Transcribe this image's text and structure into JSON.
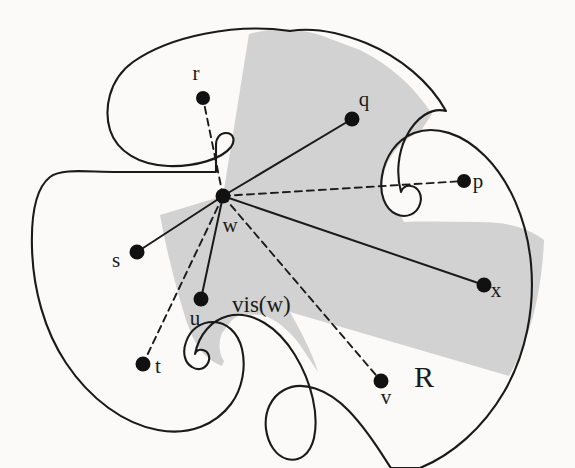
{
  "figure": {
    "colors": {
      "paper_background": "#fbfaf8",
      "shaded_region": "#d2d2d2",
      "outline": "#1a1a1a",
      "vertex": "#111111",
      "visible_edge": "#1a1a1a",
      "blocked_edge": "#1a1a1a"
    },
    "region_labels": [
      {
        "id": "vis-w",
        "text": "vis(w)",
        "x": 232,
        "y": 312,
        "size": "region"
      },
      {
        "id": "R",
        "text": "R",
        "x": 414,
        "y": 387,
        "size": "big"
      }
    ],
    "points": [
      {
        "id": "w",
        "label": "w",
        "x": 223,
        "y": 196,
        "label_x": 230,
        "label_y": 232,
        "r": 7.5
      },
      {
        "id": "r",
        "label": "r",
        "x": 203,
        "y": 98,
        "label_x": 196,
        "label_y": 80,
        "r": 7
      },
      {
        "id": "q",
        "label": "q",
        "x": 352,
        "y": 119,
        "label_x": 364,
        "label_y": 106,
        "r": 7.5
      },
      {
        "id": "p",
        "label": "p",
        "x": 464,
        "y": 181,
        "label_x": 478,
        "label_y": 188,
        "r": 7
      },
      {
        "id": "s",
        "label": "s",
        "x": 137,
        "y": 252,
        "label_x": 116,
        "label_y": 267,
        "r": 7.5
      },
      {
        "id": "u",
        "label": "u",
        "x": 201,
        "y": 299,
        "label_x": 195,
        "label_y": 325,
        "r": 7.5
      },
      {
        "id": "t",
        "label": "t",
        "x": 143,
        "y": 364,
        "label_x": 158,
        "label_y": 373,
        "r": 7.5
      },
      {
        "id": "v",
        "label": "v",
        "x": 381,
        "y": 381,
        "label_x": 386,
        "label_y": 404,
        "r": 7.5
      },
      {
        "id": "x",
        "label": "x",
        "x": 484,
        "y": 285,
        "label_x": 496,
        "label_y": 297,
        "r": 7.5
      }
    ],
    "edges": [
      {
        "id": "w-q",
        "from": "w",
        "to": "q",
        "style": "solid",
        "visible": true
      },
      {
        "id": "w-s",
        "from": "w",
        "to": "s",
        "style": "solid",
        "visible": true
      },
      {
        "id": "w-u",
        "from": "w",
        "to": "u",
        "style": "solid",
        "visible": true
      },
      {
        "id": "w-x",
        "from": "w",
        "to": "x",
        "style": "solid",
        "visible": true
      },
      {
        "id": "w-r",
        "from": "w",
        "to": "r",
        "style": "dashed",
        "visible": false
      },
      {
        "id": "w-p",
        "from": "w",
        "to": "p",
        "style": "dashed",
        "visible": false
      },
      {
        "id": "w-t",
        "from": "w",
        "to": "t",
        "style": "dashed",
        "visible": false
      },
      {
        "id": "w-v",
        "from": "w",
        "to": "v",
        "style": "dashed",
        "visible": false
      }
    ],
    "geometry": {
      "region_outline": "M 290 31 C 235 23 170 36 133 62 C 108 80 104 110 110 130 C 117 152 140 165 168 166 C 195 167 222 159 231 147 C 236 140 233 133 226 133 C 220 133 216 138 216 145 L 216 172 L 118 172 C 86 172 62 168 50 177 C 36 188 31 214 32 248 C 33 288 44 330 66 363 C 90 399 124 424 158 430 C 190 436 216 424 231 404 C 243 388 246 366 242 349 C 238 332 226 322 213 322 C 200 322 190 330 186 342 C 182 353 185 363 192 367 C 198 371 205 369 208 363 C 211 357 208 351 203 350 C 199 349 196 351 195 354 L 195 354 C 199 334 212 320 228 316 C 252 310 278 327 295 355 C 312 383 319 415 314 438 C 310 455 299 462 287 459 C 276 456 268 444 266 429 C 264 412 271 397 284 390 C 302 380 328 389 349 411 C 372 435 388 465 391 468 L 420 468 C 452 455 483 428 504 392 C 526 354 535 308 531 264 C 527 219 509 180 485 156 C 462 133 435 125 414 133 C 396 140 385 157 382 176 C 379 194 385 209 396 214 C 406 219 417 214 420 204 C 423 195 418 187 411 186 C 406 185 402 188 401 192 L 401 192 C 396 174 398 153 406 137 C 416 117 432 107 446 111 L 446 111 C 430 82 400 57 366 43 C 341 33 314 27 290 31 Z",
      "visibility_polygon": "M 223 196 L 249 34 C 277 26 300 29 320 35 L 360 50 C 392 66 415 88 432 114 L 420 132 C 398 141 386 160 383 178 C 380 196 386 211 397 215 L 401 216 L 404 222 C 430 221 455 222 480 222 C 508 222 528 228 544 240 C 542 290 531 338 509 376 L 290 312 C 300 330 312 352 318 372 L 300 345 C 290 331 276 319 262 315 L 241 314 L 232 320 L 222 333 C 218 343 219 354 224 361 L 222 366 C 214 363 206 357 200 350 L 192 336 L 186 320 L 180 300 C 172 272 165 243 160 215 L 223 196 Z"
    }
  }
}
